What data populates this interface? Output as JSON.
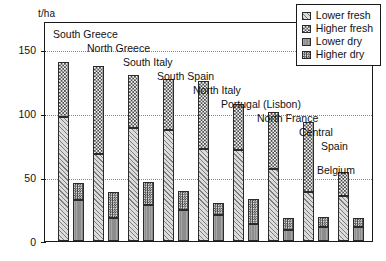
{
  "axis": {
    "unit_label": "t/ha",
    "y_ticks": [
      "150",
      "100",
      "50",
      "0"
    ],
    "y_min": 0,
    "y_max": 172
  },
  "legend": {
    "items": [
      {
        "label": "Lower fresh",
        "pattern": "p-lowerfresh"
      },
      {
        "label": "Higher fresh",
        "pattern": "p-higherfresh"
      },
      {
        "label": "Lower dry",
        "pattern": "p-lowerdry"
      },
      {
        "label": "Higher dry",
        "pattern": "p-higherdry"
      }
    ]
  },
  "region_labels": [
    {
      "text": "South Greece",
      "x": 8,
      "y": 6
    },
    {
      "text": "North Greece",
      "x": 42,
      "y": 20
    },
    {
      "text": "South Italy",
      "x": 78,
      "y": 34
    },
    {
      "text": "South Spain",
      "x": 112,
      "y": 48
    },
    {
      "text": "North Italy",
      "x": 148,
      "y": 62
    },
    {
      "text": "Portugal (Lisbon)",
      "x": 176,
      "y": 76
    },
    {
      "text": "North France",
      "x": 212,
      "y": 90
    },
    {
      "text": "Central",
      "x": 254,
      "y": 104
    },
    {
      "text": "Spain",
      "x": 276,
      "y": 118
    },
    {
      "text": "Belgium",
      "x": 272,
      "y": 142
    }
  ],
  "chart_data": {
    "type": "bar",
    "title": "",
    "xlabel": "",
    "ylabel": "t/ha",
    "ylim": [
      0,
      172
    ],
    "grid": true,
    "legend_position": "top-right",
    "stacked": true,
    "categories": [
      "South Greece",
      "North Greece",
      "South Italy",
      "South Spain",
      "North Italy",
      "Portugal (Lisbon)",
      "North France",
      "Central Spain",
      "Belgium"
    ],
    "series": [
      {
        "name": "Lower fresh",
        "values": [
          97,
          68,
          88,
          87,
          72,
          71,
          56,
          38,
          35
        ]
      },
      {
        "name": "Higher fresh",
        "values": [
          43,
          69,
          42,
          40,
          53,
          36,
          45,
          55,
          19
        ]
      },
      {
        "name": "Lower dry",
        "values": [
          32,
          18,
          28,
          24,
          20,
          13,
          9,
          11,
          11
        ]
      },
      {
        "name": "Higher dry",
        "values": [
          13,
          20,
          18,
          15,
          10,
          20,
          9,
          8,
          7
        ]
      }
    ],
    "totals_fresh": [
      140,
      137,
      130,
      127,
      125,
      107,
      101,
      93,
      54
    ],
    "totals_dry": [
      45,
      38,
      46,
      39,
      30,
      33,
      18,
      19,
      18
    ]
  },
  "bars": [
    {
      "group": "South Greece",
      "fresh_x": 13,
      "dry_x": 28,
      "lower_fresh": 97,
      "higher_fresh": 43,
      "lower_dry": 32,
      "higher_dry": 13
    },
    {
      "group": "North Greece",
      "fresh_x": 48,
      "dry_x": 63,
      "lower_fresh": 68,
      "higher_fresh": 69,
      "lower_dry": 18,
      "higher_dry": 20
    },
    {
      "group": "South Italy",
      "fresh_x": 83,
      "dry_x": 98,
      "lower_fresh": 88,
      "higher_fresh": 42,
      "lower_dry": 28,
      "higher_dry": 18
    },
    {
      "group": "South Spain",
      "fresh_x": 118,
      "dry_x": 133,
      "lower_fresh": 87,
      "higher_fresh": 40,
      "lower_dry": 24,
      "higher_dry": 15
    },
    {
      "group": "North Italy",
      "fresh_x": 153,
      "dry_x": 168,
      "lower_fresh": 72,
      "higher_fresh": 53,
      "lower_dry": 20,
      "higher_dry": 10
    },
    {
      "group": "Portugal (Lisbon)",
      "fresh_x": 188,
      "dry_x": 203,
      "lower_fresh": 71,
      "higher_fresh": 36,
      "lower_dry": 13,
      "higher_dry": 20
    },
    {
      "group": "North France",
      "fresh_x": 223,
      "dry_x": 238,
      "lower_fresh": 56,
      "higher_fresh": 45,
      "lower_dry": 9,
      "higher_dry": 9
    },
    {
      "group": "Central Spain",
      "fresh_x": 258,
      "dry_x": 273,
      "lower_fresh": 38,
      "higher_fresh": 55,
      "lower_dry": 11,
      "higher_dry": 8
    },
    {
      "group": "Belgium",
      "fresh_x": 293,
      "dry_x": 308,
      "lower_fresh": 35,
      "higher_fresh": 19,
      "lower_dry": 11,
      "higher_dry": 7
    }
  ],
  "layout": {
    "bar_width": 11,
    "plot_height": 220
  }
}
